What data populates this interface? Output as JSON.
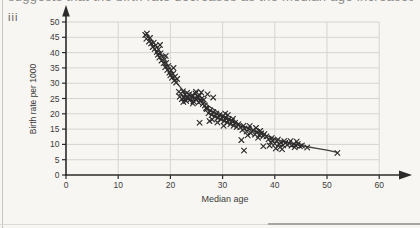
{
  "page": {
    "top_text_fragment": "suggests that the birth rate decreases as the median age increases",
    "part_label": "iii"
  },
  "chart_data": {
    "type": "scatter",
    "title": "",
    "xlabel": "Median age",
    "ylabel": "Birth rate per 1000",
    "xlim": [
      0,
      60
    ],
    "ylim": [
      0,
      50
    ],
    "x_ticks": [
      0,
      10,
      20,
      30,
      40,
      50,
      60
    ],
    "y_ticks": [
      0,
      5,
      10,
      15,
      20,
      25,
      30,
      35,
      40,
      45,
      50
    ],
    "grid": true,
    "legend": "none",
    "marker": "x",
    "marker_color": "#2e2b2c",
    "grid_color": "#d7d4d0",
    "axis_color": "#2b2b2b",
    "trend_color": "#403d3c",
    "tick_label_color": "#3c3c3c",
    "points": [
      [
        15.2,
        45.8
      ],
      [
        15.5,
        46.2
      ],
      [
        15.4,
        44.5
      ],
      [
        15.9,
        43.6
      ],
      [
        16.1,
        44.8
      ],
      [
        16.3,
        43.0
      ],
      [
        16.6,
        41.8
      ],
      [
        16.8,
        43.2
      ],
      [
        17.0,
        41.2
      ],
      [
        17.2,
        42.4
      ],
      [
        17.4,
        40.2
      ],
      [
        17.6,
        39.3
      ],
      [
        17.7,
        41.0
      ],
      [
        17.9,
        38.4
      ],
      [
        18.0,
        42.5
      ],
      [
        18.1,
        39.8
      ],
      [
        18.3,
        37.4
      ],
      [
        18.5,
        38.6
      ],
      [
        18.7,
        36.5
      ],
      [
        18.9,
        37.8
      ],
      [
        19.0,
        35.2
      ],
      [
        19.1,
        38.9
      ],
      [
        19.2,
        36.6
      ],
      [
        19.4,
        34.3
      ],
      [
        19.6,
        35.6
      ],
      [
        19.8,
        33.4
      ],
      [
        20.0,
        32.6
      ],
      [
        20.1,
        34.2
      ],
      [
        20.3,
        31.8
      ],
      [
        20.5,
        33.1
      ],
      [
        20.6,
        35.0
      ],
      [
        20.7,
        30.8
      ],
      [
        20.9,
        32.2
      ],
      [
        21.1,
        30.2
      ],
      [
        21.3,
        31.4
      ],
      [
        21.6,
        27.2
      ],
      [
        21.8,
        25.6
      ],
      [
        22.0,
        26.6
      ],
      [
        22.2,
        24.8
      ],
      [
        22.4,
        27.4
      ],
      [
        22.6,
        25.2
      ],
      [
        22.8,
        26.2
      ],
      [
        23.0,
        24.2
      ],
      [
        23.2,
        26.9
      ],
      [
        23.4,
        25.4
      ],
      [
        23.6,
        26.4
      ],
      [
        23.8,
        24.6
      ],
      [
        24.0,
        25.6
      ],
      [
        24.2,
        26.1
      ],
      [
        24.4,
        24.1
      ],
      [
        24.6,
        25.1
      ],
      [
        24.8,
        26.6
      ],
      [
        25.0,
        24.7
      ],
      [
        25.2,
        25.7
      ],
      [
        25.4,
        23.7
      ],
      [
        25.6,
        26.0
      ],
      [
        25.8,
        24.2
      ],
      [
        26.0,
        25.0
      ],
      [
        26.2,
        23.2
      ],
      [
        26.4,
        24.6
      ],
      [
        26.6,
        22.7
      ],
      [
        25.9,
        27.0
      ],
      [
        24.3,
        23.4
      ],
      [
        23.1,
        25.3
      ],
      [
        22.5,
        23.9
      ],
      [
        26.8,
        21.8
      ],
      [
        24.9,
        27.2
      ],
      [
        27.1,
        26.4
      ],
      [
        28.2,
        25.3
      ],
      [
        25.6,
        17.1
      ],
      [
        27.0,
        21.6
      ],
      [
        27.3,
        20.2
      ],
      [
        27.6,
        21.1
      ],
      [
        27.9,
        19.6
      ],
      [
        28.2,
        20.6
      ],
      [
        28.5,
        19.1
      ],
      [
        28.8,
        20.1
      ],
      [
        29.1,
        18.6
      ],
      [
        29.4,
        19.6
      ],
      [
        29.7,
        18.1
      ],
      [
        30.0,
        19.1
      ],
      [
        30.3,
        17.6
      ],
      [
        30.6,
        18.6
      ],
      [
        30.9,
        17.1
      ],
      [
        31.2,
        18.1
      ],
      [
        31.5,
        16.6
      ],
      [
        31.8,
        17.6
      ],
      [
        32.1,
        16.1
      ],
      [
        32.4,
        17.1
      ],
      [
        32.7,
        15.7
      ],
      [
        33.0,
        16.6
      ],
      [
        28.0,
        18.1
      ],
      [
        29.0,
        17.2
      ],
      [
        30.5,
        20.1
      ],
      [
        31.0,
        19.6
      ],
      [
        32.0,
        18.4
      ],
      [
        27.5,
        17.6
      ],
      [
        30.2,
        16.1
      ],
      [
        33.6,
        11.4
      ],
      [
        34.1,
        8.0
      ],
      [
        33.4,
        15.6
      ],
      [
        33.8,
        14.7
      ],
      [
        34.2,
        15.2
      ],
      [
        34.6,
        14.2
      ],
      [
        35.0,
        15.1
      ],
      [
        35.4,
        13.7
      ],
      [
        35.8,
        14.6
      ],
      [
        36.2,
        13.2
      ],
      [
        36.6,
        14.1
      ],
      [
        37.0,
        13.1
      ],
      [
        37.4,
        13.6
      ],
      [
        37.8,
        12.7
      ],
      [
        34.0,
        16.1
      ],
      [
        35.2,
        16.0
      ],
      [
        36.4,
        15.4
      ],
      [
        37.2,
        14.4
      ],
      [
        38.0,
        13.4
      ],
      [
        38.4,
        12.6
      ],
      [
        34.8,
        13.0
      ],
      [
        36.8,
        12.2
      ],
      [
        37.8,
        9.4
      ],
      [
        38.8,
        11.7
      ],
      [
        39.2,
        10.7
      ],
      [
        39.6,
        11.2
      ],
      [
        40.0,
        10.2
      ],
      [
        40.4,
        11.1
      ],
      [
        40.8,
        10.1
      ],
      [
        41.2,
        10.6
      ],
      [
        41.6,
        9.7
      ],
      [
        42.0,
        10.5
      ],
      [
        42.4,
        9.9
      ],
      [
        42.8,
        10.3
      ],
      [
        43.2,
        9.6
      ],
      [
        43.6,
        10.1
      ],
      [
        44.0,
        9.6
      ],
      [
        44.4,
        10.1
      ],
      [
        44.8,
        9.4
      ],
      [
        39.4,
        12.1
      ],
      [
        40.6,
        11.6
      ],
      [
        41.8,
        11.1
      ],
      [
        43.0,
        11.1
      ],
      [
        44.2,
        10.9
      ],
      [
        39.0,
        9.6
      ],
      [
        41.0,
        9.1
      ],
      [
        43.8,
        9.1
      ],
      [
        45.2,
        9.6
      ],
      [
        40.2,
        8.7
      ],
      [
        41.4,
        8.4
      ],
      [
        46.2,
        9.0
      ],
      [
        52.0,
        7.2
      ]
    ],
    "trend_line": [
      [
        15.5,
        46
      ],
      [
        16.5,
        42.5
      ],
      [
        17.5,
        39.5
      ],
      [
        18.5,
        37
      ],
      [
        19.5,
        34.5
      ],
      [
        20.5,
        32
      ],
      [
        21.5,
        29.5
      ],
      [
        22.5,
        27.5
      ],
      [
        23.5,
        26.3
      ],
      [
        24.5,
        25.4
      ],
      [
        25.5,
        24.6
      ],
      [
        26.5,
        23.6
      ],
      [
        27.5,
        22.4
      ],
      [
        28.5,
        21.2
      ],
      [
        29.5,
        20.1
      ],
      [
        30.5,
        19.1
      ],
      [
        31.5,
        18.2
      ],
      [
        32.5,
        17.3
      ],
      [
        33.5,
        16.4
      ],
      [
        34.5,
        15.6
      ],
      [
        35.5,
        14.8
      ],
      [
        36.5,
        14.1
      ],
      [
        37.5,
        13.4
      ],
      [
        38.5,
        12.8
      ],
      [
        39.5,
        12.2
      ],
      [
        40.5,
        11.6
      ],
      [
        41.5,
        11.1
      ],
      [
        42.5,
        10.6
      ],
      [
        43.5,
        10.2
      ],
      [
        44.5,
        9.8
      ],
      [
        46,
        9.3
      ],
      [
        48,
        8.7
      ],
      [
        50,
        8.1
      ],
      [
        52,
        7.4
      ]
    ]
  }
}
